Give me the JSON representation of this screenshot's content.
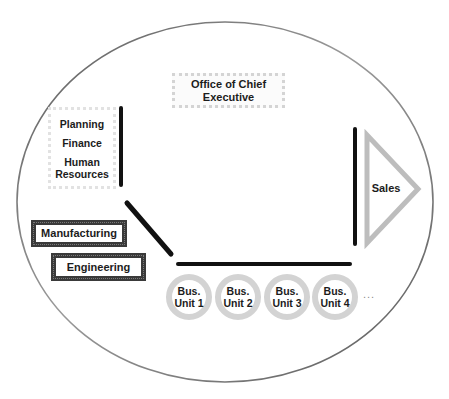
{
  "diagram": {
    "type": "organization-structure",
    "boundary": {
      "shape": "ellipse",
      "stroke": "#7a7a7a"
    },
    "office": {
      "label": "Office of Chief Executive"
    },
    "staff_functions": {
      "items": [
        {
          "label": "Planning"
        },
        {
          "label": "Finance"
        },
        {
          "label": "Human Resources"
        }
      ]
    },
    "line_functions": {
      "manufacturing": {
        "label": "Manufacturing"
      },
      "engineering": {
        "label": "Engineering"
      }
    },
    "business_units": {
      "items": [
        {
          "label": "Bus. Unit 1"
        },
        {
          "label": "Bus. Unit 2"
        },
        {
          "label": "Bus. Unit 3"
        },
        {
          "label": "Bus. Unit 4"
        }
      ],
      "more": "..."
    },
    "sales": {
      "label": "Sales"
    },
    "colors": {
      "connector": "#111111",
      "ring": "#d3d3d3",
      "triangle": "#bdbdbd",
      "line_box_border": "#3a3a3a",
      "office_border": "#d4d4d4"
    }
  }
}
